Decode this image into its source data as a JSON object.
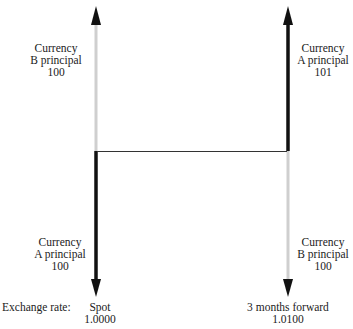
{
  "diagram": {
    "type": "currency-swap-principal-exchange",
    "colors": {
      "dark": "#111111",
      "light": "#cfcfcf",
      "connector": "#333333"
    },
    "left_column": {
      "top_label": {
        "line1": "Currency",
        "line2": "B principal",
        "line3": "100"
      },
      "bottom_label": {
        "line1": "Currency",
        "line2": "A principal",
        "line3": "100"
      },
      "timing_label": "Spot",
      "rate_value": "1.0000"
    },
    "right_column": {
      "top_label": {
        "line1": "Currency",
        "line2": "A principal",
        "line3": "101"
      },
      "bottom_label": {
        "line1": "Currency",
        "line2": "B principal",
        "line3": "100"
      },
      "timing_label": "3 months forward",
      "rate_value": "1.0100"
    },
    "row_label": "Exchange rate:"
  }
}
